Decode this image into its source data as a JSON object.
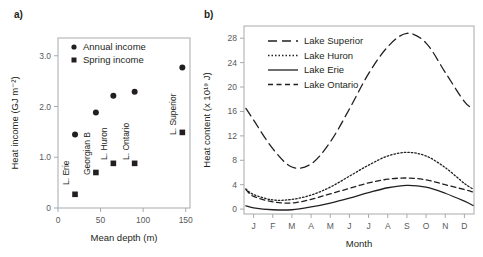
{
  "figure": {
    "panel_a_label": "a)",
    "panel_b_label": "b)"
  },
  "chart_data": [
    {
      "id": "panel-a",
      "type": "scatter",
      "title": "",
      "xlabel": "Mean depth (m)",
      "ylabel": "Heat income (GJ m⁻²)",
      "xlim": [
        0,
        155
      ],
      "ylim": [
        0,
        3.35
      ],
      "xticks": [
        0,
        50,
        100,
        150
      ],
      "xticklabels": [
        "0",
        "50",
        "100",
        "150"
      ],
      "yticks": [
        0,
        1.0,
        2.0,
        3.0
      ],
      "yticklabels": [
        "0",
        "1.0",
        "2.0",
        "3.0"
      ],
      "grid": false,
      "legend_position": "top-left",
      "legend": [
        {
          "label": "Annual income",
          "marker": "circle"
        },
        {
          "label": "Spring income",
          "marker": "square"
        }
      ],
      "point_labels": [
        "L. Erie",
        "Georgian B",
        "L. Huron",
        "L. Ontario",
        "L. Superior"
      ],
      "x": [
        20,
        44.5,
        65,
        90,
        146
      ],
      "series": [
        {
          "name": "Annual income",
          "marker": "circle",
          "values": [
            1.45,
            1.88,
            2.21,
            2.29,
            2.77
          ]
        },
        {
          "name": "Spring income",
          "marker": "square",
          "values": [
            0.27,
            0.7,
            0.88,
            0.88,
            1.49
          ]
        }
      ]
    },
    {
      "id": "panel-b",
      "type": "line",
      "title": "",
      "xlabel": "Month",
      "ylabel": "Heat content (x 10¹⁹ J)",
      "xlim": [
        0.5,
        12.5
      ],
      "ylim": [
        -0.8,
        30
      ],
      "xticks": [
        1,
        2,
        3,
        4,
        5,
        6,
        7,
        8,
        9,
        10,
        11,
        12
      ],
      "xticklabels": [
        "J",
        "F",
        "M",
        "A",
        "M",
        "J",
        "J",
        "A",
        "S",
        "O",
        "N",
        "D"
      ],
      "yticks": [
        0,
        4,
        8,
        12,
        16,
        20,
        24,
        28
      ],
      "yticklabels": [
        "0",
        "4",
        "8",
        "12",
        "16",
        "20",
        "24",
        "28"
      ],
      "grid": false,
      "legend_position": "top-left",
      "x": [
        0.6,
        1,
        2,
        3,
        4,
        5,
        6,
        7,
        8,
        9,
        10,
        11,
        12,
        12.45
      ],
      "series": [
        {
          "name": "Lake Superior",
          "style": "long-dash",
          "values": [
            16.5,
            14.6,
            9.9,
            6.9,
            7.4,
            11.0,
            16.4,
            22.2,
            26.6,
            28.8,
            27.2,
            22.4,
            17.6,
            16.5
          ]
        },
        {
          "name": "Lake Huron",
          "style": "dotted",
          "values": [
            3.3,
            2.4,
            1.5,
            1.6,
            2.3,
            3.6,
            5.4,
            7.2,
            8.7,
            9.3,
            8.7,
            6.8,
            4.2,
            3.3
          ]
        },
        {
          "name": "Lake Erie",
          "style": "solid",
          "values": [
            0.55,
            0.2,
            -0.1,
            -0.1,
            0.35,
            1.0,
            1.8,
            2.7,
            3.5,
            3.9,
            3.6,
            2.6,
            1.3,
            0.6
          ]
        },
        {
          "name": "Lake Ontario",
          "style": "dash",
          "values": [
            3.2,
            2.1,
            1.2,
            1.0,
            1.6,
            2.5,
            3.4,
            4.3,
            4.9,
            5.1,
            4.8,
            4.0,
            3.2,
            2.8
          ]
        }
      ]
    }
  ]
}
